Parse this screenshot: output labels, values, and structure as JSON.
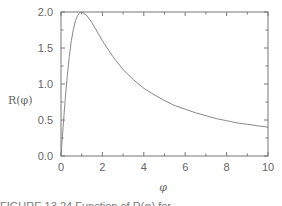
{
  "chart_data": {
    "type": "line",
    "title": "",
    "xlabel": "φ",
    "ylabel": "R(φ)",
    "xlim": [
      0,
      10
    ],
    "ylim": [
      0,
      2.0
    ],
    "xticks": [
      "0",
      "2",
      "4",
      "6",
      "8",
      "10"
    ],
    "yticks": [
      "0.0",
      "0.5",
      "1.0",
      "1.5",
      "2.0"
    ],
    "grid": false,
    "legend": null,
    "series": [
      {
        "name": "R(φ)",
        "x": [
          0,
          0.1,
          0.2,
          0.3,
          0.4,
          0.5,
          0.6,
          0.7,
          0.8,
          0.9,
          1.0,
          1.25,
          1.5,
          2,
          2.5,
          3,
          3.5,
          4,
          4.5,
          5,
          5.5,
          6,
          6.5,
          7,
          7.5,
          8,
          8.5,
          9,
          9.5,
          10
        ],
        "values": [
          0,
          0.4,
          0.77,
          1.1,
          1.38,
          1.6,
          1.76,
          1.88,
          1.95,
          1.99,
          2.0,
          1.95,
          1.85,
          1.6,
          1.38,
          1.2,
          1.06,
          0.94,
          0.85,
          0.77,
          0.7,
          0.65,
          0.6,
          0.56,
          0.52,
          0.49,
          0.46,
          0.44,
          0.42,
          0.4
        ]
      }
    ],
    "annotations": []
  },
  "caption": {
    "text": "FIGURE 13.24 Function of R(φ) for..."
  }
}
